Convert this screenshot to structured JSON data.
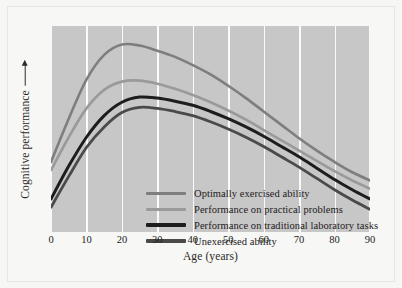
{
  "chart_data": {
    "type": "line",
    "title": "",
    "xlabel": "Age (years)",
    "ylabel": "Cognitive performance",
    "xlim": [
      0,
      90
    ],
    "ylim": [
      0,
      100
    ],
    "xticks": [
      0,
      10,
      20,
      30,
      40,
      50,
      60,
      70,
      80,
      90
    ],
    "yticks": [],
    "grid": "vertical",
    "legend_position": "inside-lower-left",
    "x": [
      0,
      5,
      10,
      15,
      20,
      25,
      30,
      35,
      40,
      45,
      50,
      55,
      60,
      65,
      70,
      75,
      80,
      85,
      90
    ],
    "series": [
      {
        "name": "Optimally exercised ability",
        "color": "#7e7e7e",
        "width": 2.6,
        "values": [
          34,
          55,
          74,
          86,
          91,
          90.5,
          88,
          85,
          81,
          76.5,
          71,
          65,
          58.5,
          52,
          45.5,
          39.5,
          34,
          29,
          25
        ]
      },
      {
        "name": "Performance on practical problems",
        "color": "#9a9a9a",
        "width": 2.6,
        "values": [
          30,
          46,
          60,
          69,
          73,
          73.5,
          72,
          69.5,
          66.5,
          63,
          59,
          54.5,
          49.5,
          44.5,
          39.5,
          34.5,
          29.5,
          25,
          21
        ]
      },
      {
        "name": "Performance on traditional laboratory tasks",
        "color": "#1d1d1d",
        "width": 3.0,
        "values": [
          16,
          32,
          46,
          56.5,
          63,
          65.5,
          65,
          63.5,
          61.5,
          58.5,
          55,
          51,
          46.5,
          41.5,
          36.5,
          31,
          25.5,
          20.5,
          16
        ]
      },
      {
        "name": "Unexercised ability",
        "color": "#4a4a4a",
        "width": 2.8,
        "values": [
          12,
          27,
          41,
          51,
          58,
          60.5,
          60,
          58.5,
          56.5,
          53.5,
          50,
          46,
          41.5,
          36.5,
          31.5,
          26,
          20.5,
          15.5,
          11
        ]
      }
    ]
  },
  "legend": {
    "items": [
      {
        "label": "Optimally exercised ability",
        "color": "#7e7e7e",
        "thickness": "3px"
      },
      {
        "label": "Performance on practical problems",
        "color": "#9a9a9a",
        "thickness": "3px"
      },
      {
        "label": "Performance on traditional laboratory tasks",
        "color": "#1d1d1d",
        "thickness": "3.6px"
      },
      {
        "label": "Unexercised ability",
        "color": "#4a4a4a",
        "thickness": "3.2px"
      }
    ]
  },
  "axes": {
    "x_label": "Age (years)",
    "y_label": "Cognitive performance",
    "x_tick_labels": [
      "0",
      "10",
      "20",
      "30",
      "40",
      "50",
      "60",
      "70",
      "80",
      "90"
    ]
  },
  "colors": {
    "plot_background": "#c7c7c7",
    "page_background": "#f6f6f4",
    "gridline": "#fafafa",
    "text": "#24201c"
  }
}
